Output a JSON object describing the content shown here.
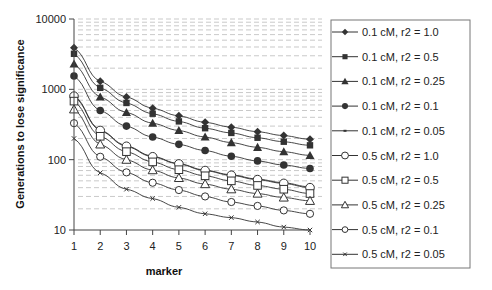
{
  "chart_data": {
    "type": "line",
    "title": "",
    "xlabel": "marker",
    "ylabel": "Generations to lose significance",
    "yscale": "log",
    "ylim": [
      10,
      10000
    ],
    "xlim": [
      1,
      10
    ],
    "x": [
      1,
      2,
      3,
      4,
      5,
      6,
      7,
      8,
      9,
      10
    ],
    "xticks": [
      "1",
      "2",
      "3",
      "4",
      "5",
      "6",
      "7",
      "8",
      "9",
      "10"
    ],
    "yticks": [
      "10",
      "100",
      "1000",
      "10000"
    ],
    "grid": "horizontal dashed minor log gridlines",
    "legend_position": "right",
    "series": [
      {
        "name": "0.1 cM, r2 = 1.0",
        "marker": "diamond-filled",
        "values": [
          3900,
          1300,
          780,
          540,
          420,
          340,
          290,
          250,
          220,
          195
        ]
      },
      {
        "name": "0.1 cM, r2 = 0.5",
        "marker": "square-filled",
        "values": [
          3200,
          1050,
          640,
          450,
          350,
          280,
          240,
          205,
          180,
          160
        ]
      },
      {
        "name": "0.1 cM, r2 = 0.25",
        "marker": "triangle-filled",
        "values": [
          2300,
          780,
          470,
          330,
          260,
          210,
          175,
          150,
          130,
          115
        ]
      },
      {
        "name": "0.1 cM, r2 = 0.1",
        "marker": "circle-filled",
        "values": [
          1550,
          500,
          300,
          210,
          165,
          135,
          112,
          96,
          84,
          75
        ]
      },
      {
        "name": "0.1 cM, r2 = 0.05",
        "marker": "dash",
        "values": [
          820,
          265,
          158,
          112,
          88,
          71,
          61,
          53,
          47,
          41
        ]
      },
      {
        "name": "0.5 cM, r2 = 1.0",
        "marker": "circle-open",
        "values": [
          800,
          260,
          155,
          110,
          87,
          70,
          60,
          52,
          46,
          40
        ]
      },
      {
        "name": "0.5 cM, r2 = 0.5",
        "marker": "square-open",
        "values": [
          680,
          215,
          130,
          93,
          72,
          59,
          50,
          43,
          38,
          33
        ]
      },
      {
        "name": "0.5 cM, r2 = 0.25",
        "marker": "triangle-open",
        "values": [
          520,
          165,
          100,
          71,
          55,
          45,
          38,
          33,
          29,
          26
        ]
      },
      {
        "name": "0.5 cM, r2 = 0.1",
        "marker": "circle-open-small",
        "values": [
          330,
          110,
          66,
          47,
          37,
          30,
          25,
          22,
          19,
          17
        ]
      },
      {
        "name": "0.5 cM, r2 = 0.05",
        "marker": "x",
        "values": [
          200,
          65,
          38,
          28,
          21,
          17,
          15,
          13,
          11,
          10
        ]
      }
    ]
  },
  "colors": {
    "line": "#333333",
    "axis": "#444444",
    "grid": "#bbbbbb",
    "legend_border": "#777777"
  }
}
